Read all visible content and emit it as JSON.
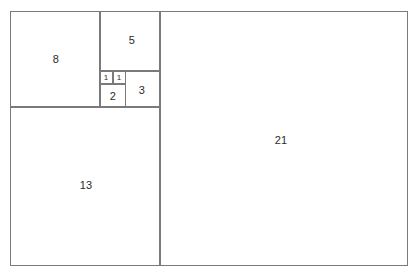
{
  "diagram": {
    "background_color": "#ffffff",
    "line_color": "#7a7a7a",
    "label_color": "#2b2b2b",
    "width": 418,
    "height": 278,
    "squares": [
      {
        "id": "square-21",
        "label": "21",
        "value": 21,
        "x": 160,
        "y": 11,
        "size_w": 248,
        "size_h": 255,
        "label_x": 281,
        "label_y": 140,
        "label_size": "normal"
      },
      {
        "id": "square-13",
        "label": "13",
        "value": 13,
        "x": 10,
        "y": 107,
        "size_w": 150,
        "size_h": 159,
        "label_x": 86,
        "label_y": 185,
        "label_size": "normal"
      },
      {
        "id": "square-8",
        "label": "8",
        "value": 8,
        "x": 10,
        "y": 11,
        "size_w": 90,
        "size_h": 96,
        "label_x": 56,
        "label_y": 59,
        "label_size": "normal"
      },
      {
        "id": "square-5",
        "label": "5",
        "value": 5,
        "x": 100,
        "y": 11,
        "size_w": 60,
        "size_h": 60,
        "label_x": 132,
        "label_y": 40,
        "label_size": "normal"
      },
      {
        "id": "square-3",
        "label": "3",
        "value": 3,
        "x": 125,
        "y": 71,
        "size_w": 35,
        "size_h": 36,
        "label_x": 142,
        "label_y": 90,
        "label_size": "normal"
      },
      {
        "id": "square-2",
        "label": "2",
        "value": 2,
        "x": 100,
        "y": 84,
        "size_w": 26,
        "size_h": 23,
        "label_x": 113,
        "label_y": 96,
        "label_size": "normal"
      },
      {
        "id": "square-1-left",
        "label": "1",
        "value": 1,
        "x": 100,
        "y": 71,
        "size_w": 13,
        "size_h": 13,
        "label_x": 106,
        "label_y": 78,
        "label_size": "tiny"
      },
      {
        "id": "square-1-right",
        "label": "1",
        "value": 1,
        "x": 113,
        "y": 71,
        "size_w": 13,
        "size_h": 13,
        "label_x": 119,
        "label_y": 78,
        "label_size": "tiny"
      }
    ]
  },
  "chart_data": {
    "type": "diagram",
    "sequence": [
      1,
      1,
      2,
      3,
      5,
      8,
      13,
      21
    ],
    "labels": [
      "1",
      "1",
      "2",
      "3",
      "5",
      "8",
      "13",
      "21"
    ],
    "xlabel": "",
    "ylabel": "",
    "grid": false,
    "legend": false
  }
}
